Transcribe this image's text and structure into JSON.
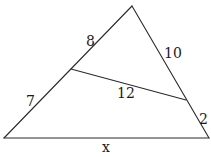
{
  "diagram": {
    "type": "triangle-with-parallel-segment",
    "colors": {
      "background": "#ffffff",
      "stroke": "#2a2a2a",
      "text": "#1a1a1a"
    },
    "vertices": {
      "apex": {
        "x": 132,
        "y": 6
      },
      "bottom_left": {
        "x": 4,
        "y": 138
      },
      "bottom_right": {
        "x": 209,
        "y": 138
      },
      "inner_left": {
        "x": 71,
        "y": 69
      },
      "inner_right": {
        "x": 186,
        "y": 100
      }
    },
    "labels": {
      "upper_left_side": {
        "text": "8",
        "x": 86,
        "y": 46
      },
      "lower_left_side": {
        "text": "7",
        "x": 26,
        "y": 106
      },
      "upper_right_side": {
        "text": "10",
        "x": 164,
        "y": 58
      },
      "lower_right_side": {
        "text": "2",
        "x": 199,
        "y": 124
      },
      "inner_segment": {
        "text": "12",
        "x": 117,
        "y": 98
      },
      "base": {
        "text": "x",
        "x": 102,
        "y": 152
      }
    }
  }
}
